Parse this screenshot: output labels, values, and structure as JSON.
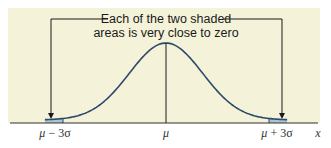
{
  "chart_data": {
    "type": "area",
    "title": "",
    "subtitle": "",
    "xlabel": "x",
    "ylabel": "",
    "distribution": "normal",
    "x_ticks": [
      "μ − 3σ",
      "μ",
      "μ + 3σ"
    ],
    "x_tick_positions_sd": [
      -3,
      0,
      3
    ],
    "shaded_regions": [
      {
        "name": "left tail",
        "from_sd": "-inf",
        "to_sd": -3,
        "area_approx": 0.00135
      },
      {
        "name": "right tail",
        "from_sd": 3,
        "to_sd": "inf",
        "area_approx": 0.00135
      }
    ],
    "annotations": [
      {
        "text": "Each of the two shaded areas is very close to zero",
        "points_to": [
          "left tail",
          "right tail"
        ]
      }
    ],
    "grid": false,
    "legend": null,
    "colors": {
      "background": "#f4f2d8",
      "curve": "#2e4a6b",
      "shade": "#a9c6cf",
      "axis": "#333333",
      "arrow": "#1a1a1a"
    }
  },
  "labels": {
    "annotation_line1": "Each of the two shaded",
    "annotation_line2": "areas is very close to zero",
    "tick_left_mu": "μ",
    "tick_left_rest": " − 3σ",
    "tick_center": "μ",
    "tick_right_mu": "μ",
    "tick_right_rest": " + 3σ",
    "axis_label": "x"
  }
}
